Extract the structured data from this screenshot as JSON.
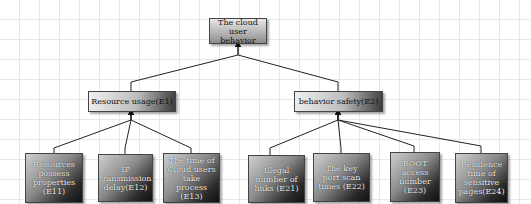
{
  "diagram": {
    "type": "hierarchy-tree",
    "root": {
      "id": "root",
      "label": "The cloud user behavior"
    },
    "level1": [
      {
        "id": "E1",
        "label": "Resource usage(E1)"
      },
      {
        "id": "E2",
        "label": "behavior safety(E2)"
      }
    ],
    "level2": [
      {
        "id": "E11",
        "parent": "E1",
        "label": "Resources possess properties (E11)"
      },
      {
        "id": "E12",
        "parent": "E1",
        "label": "IP transmission delay(E12)"
      },
      {
        "id": "E13",
        "parent": "E1",
        "label": "The time of Cloud users take process (E13)"
      },
      {
        "id": "E21",
        "parent": "E2",
        "label": "Illegal number of links (E21)"
      },
      {
        "id": "E22",
        "parent": "E2",
        "label": "The key port scan times (E22)"
      },
      {
        "id": "E23",
        "parent": "E2",
        "label": "ROOT access number (E23)"
      },
      {
        "id": "E24",
        "parent": "E2",
        "label": "Residence time of sensitive pages(E24)"
      }
    ],
    "edges": [
      [
        "E1",
        "root"
      ],
      [
        "E2",
        "root"
      ],
      [
        "E11",
        "E1"
      ],
      [
        "E12",
        "E1"
      ],
      [
        "E13",
        "E1"
      ],
      [
        "E21",
        "E2"
      ],
      [
        "E22",
        "E2"
      ],
      [
        "E23",
        "E2"
      ],
      [
        "E24",
        "E2"
      ]
    ]
  }
}
